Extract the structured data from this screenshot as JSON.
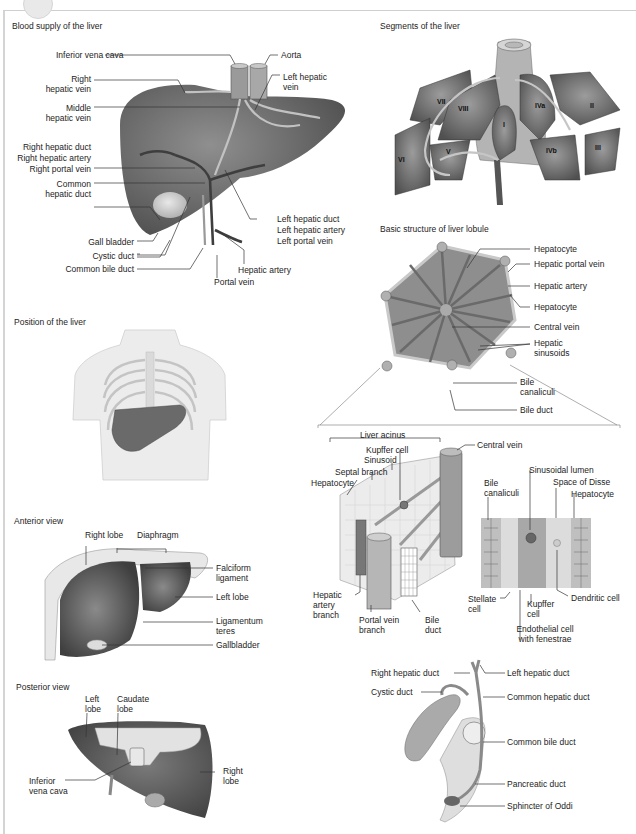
{
  "panels": {
    "blood_supply": {
      "title": "Blood supply of the liver",
      "labels": {
        "inferior_vena_cava": "Inferior vena cava",
        "aorta": "Aorta",
        "right_hepatic_vein_1": "Right",
        "right_hepatic_vein_2": "hepatic vein",
        "left_hepatic_vein_1": "Left hepatic",
        "left_hepatic_vein_2": "vein",
        "middle_hepatic_vein_1": "Middle",
        "middle_hepatic_vein_2": "hepatic vein",
        "right_hepatic_duct": "Right hepatic duct",
        "right_hepatic_artery": "Right hepatic artery",
        "right_portal_vein": "Right portal vein",
        "common_hepatic_duct_1": "Common",
        "common_hepatic_duct_2": "hepatic duct",
        "gall_bladder": "Gall bladder",
        "cystic_duct": "Cystic duct",
        "common_bile_duct": "Common bile duct",
        "left_hepatic_duct": "Left hepatic duct",
        "left_hepatic_artery": "Left hepatic artery",
        "left_portal_vein": "Left portal vein",
        "hepatic_artery": "Hepatic artery",
        "portal_vein": "Portal vein"
      }
    },
    "segments": {
      "title": "Segments of the liver",
      "segments": [
        "VII",
        "VIII",
        "VI",
        "V",
        "I",
        "IVa",
        "IVb",
        "II",
        "III"
      ]
    },
    "lobule": {
      "title": "Basic structure of liver lobule",
      "labels": {
        "hepatocyte_1": "Hepatocyte",
        "hepatic_portal_vein": "Hepatic portal vein",
        "hepatic_artery": "Hepatic artery",
        "hepatocyte_2": "Hepatocyte",
        "central_vein": "Central vein",
        "hepatic_sinusoids_1": "Hepatic",
        "hepatic_sinusoids_2": "sinusoids",
        "bile_canaliculi_1": "Bile",
        "bile_canaliculi_2": "canaliculi",
        "bile_duct": "Bile duct"
      }
    },
    "acinus": {
      "labels": {
        "liver_acinus": "Liver acinus",
        "kupffer_cell": "Kupffer cell",
        "sinusoid": "Sinusoid",
        "septal_branch": "Septal branch",
        "hepatocyte": "Hepatocyte",
        "central_vein": "Central vein",
        "hepatic_artery_branch_1": "Hepatic",
        "hepatic_artery_branch_2": "artery",
        "hepatic_artery_branch_3": "branch",
        "portal_vein_branch_1": "Portal vein",
        "portal_vein_branch_2": "branch",
        "bile_duct_1": "Bile",
        "bile_duct_2": "duct"
      }
    },
    "sinusoid_detail": {
      "labels": {
        "bile_canaliculi_1": "Bile",
        "bile_canaliculi_2": "canaliculi",
        "sinusoidal_lumen": "Sinusoidal lumen",
        "space_of_disse": "Space of Disse",
        "hepatocyte": "Hepatocyte",
        "stellate_cell_1": "Stellate",
        "stellate_cell_2": "cell",
        "kupffer_cell_1": "Kupffer",
        "kupffer_cell_2": "cell",
        "dendritic_cell": "Dendritic cell",
        "endothelial_cell_1": "Endothelial cell",
        "endothelial_cell_2": "with fenestrae"
      }
    },
    "position": {
      "title": "Position of the liver"
    },
    "anterior": {
      "title": "Anterior view",
      "labels": {
        "right_lobe": "Right lobe",
        "diaphragm": "Diaphragm",
        "falciform_1": "Falciform",
        "falciform_2": "ligament",
        "left_lobe": "Left lobe",
        "ligamentum_teres_1": "Ligamentum",
        "ligamentum_teres_2": "teres",
        "gallbladder": "Gallbladder"
      }
    },
    "posterior": {
      "title": "Posterior view",
      "labels": {
        "left_lobe_1": "Left",
        "left_lobe_2": "lobe",
        "caudate_lobe_1": "Caudate",
        "caudate_lobe_2": "lobe",
        "ivc_1": "Inferior",
        "ivc_2": "vena cava",
        "right_lobe_1": "Right",
        "right_lobe_2": "lobe"
      }
    },
    "biliary": {
      "labels": {
        "right_hepatic_duct": "Right hepatic duct",
        "left_hepatic_duct": "Left hepatic duct",
        "cystic_duct": "Cystic duct",
        "common_hepatic_duct": "Common hepatic duct",
        "common_bile_duct": "Common bile duct",
        "pancreatic_duct": "Pancreatic duct",
        "sphincter_of_oddi": "Sphincter of Oddi"
      }
    }
  },
  "colors": {
    "liver_dark": "#5e5e5e",
    "liver_mid": "#8a8a8a",
    "vessel_light": "#b9b9b9",
    "paper": "#ffffff",
    "frame": "#d4d4d4"
  }
}
